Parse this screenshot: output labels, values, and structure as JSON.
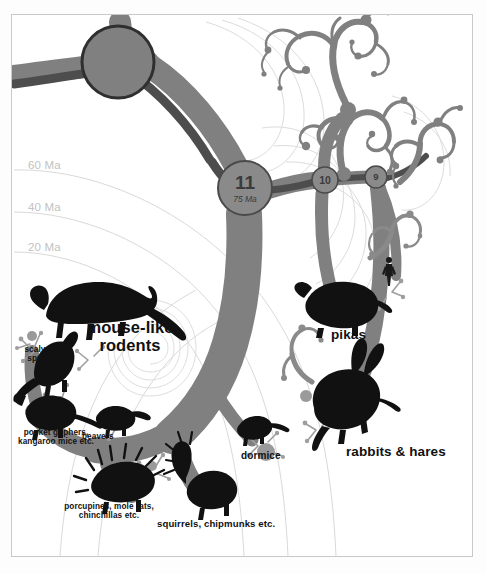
{
  "figure": {
    "kind": "phylogenetic-tree",
    "background_color": "#ffffff",
    "frame_color": "#c9c9c9",
    "branch_color": "#808080",
    "branch_dark_color": "#4d4d4d",
    "silhouette_color": "#111111",
    "axis_color": "#c2c2c2",
    "label_color": "#111111"
  },
  "axis": {
    "name": "time-axis",
    "unit": "Ma",
    "ticks": [
      {
        "label": "60 Ma",
        "value": 60
      },
      {
        "label": "40 Ma",
        "value": 40
      },
      {
        "label": "20 Ma",
        "value": 20
      }
    ]
  },
  "nodes": [
    {
      "id": "root-node",
      "number": "",
      "age": "",
      "cx": 118,
      "cy": 62,
      "r": 36,
      "style": "large-plain"
    },
    {
      "id": "node-11",
      "number": "11",
      "age": "75 Ma",
      "cx": 245,
      "cy": 188,
      "r": 27,
      "style": "labelled"
    },
    {
      "id": "node-10",
      "number": "10",
      "age": "",
      "cx": 325,
      "cy": 180,
      "r": 13,
      "style": "labelled"
    },
    {
      "id": "node-9",
      "number": "9",
      "age": "",
      "cx": 376,
      "cy": 177,
      "r": 11,
      "style": "labelled"
    }
  ],
  "taxa": [
    {
      "name": "mouse-like-rodents",
      "label": "mouse-like\nrodents",
      "size": "big",
      "x": 78,
      "y": 318
    },
    {
      "name": "scaly-tails-springhare",
      "label": "scaly-tails &\nspringhare",
      "size": "tiny",
      "x": 10,
      "y": 345
    },
    {
      "name": "pocket-gophers-kangaroo-mice",
      "label": "pocket gophers,\nkangaroo mice etc.",
      "size": "tiny",
      "x": 8,
      "y": 428
    },
    {
      "name": "beavers",
      "label": "beavers",
      "size": "tiny",
      "x": 82,
      "y": 432
    },
    {
      "name": "porcupines-mole-rats-chinchillas",
      "label": "porcupines, mole rats,\nchinchillas etc.",
      "size": "tiny",
      "x": 54,
      "y": 502
    },
    {
      "name": "squirrels-chipmunks",
      "label": "squirrels, chipmunks etc.",
      "size": "small",
      "x": 157,
      "y": 519
    },
    {
      "name": "dormice",
      "label": "dormice",
      "size": "small",
      "x": 241,
      "y": 450
    },
    {
      "name": "pikas",
      "label": "pikas",
      "size": "mid",
      "x": 331,
      "y": 327
    },
    {
      "name": "rabbits-hares",
      "label": "rabbits & hares",
      "size": "mid",
      "x": 346,
      "y": 444
    }
  ],
  "silhouettes": [
    {
      "name": "rat-silhouette",
      "taxon": "mouse-like rodents"
    },
    {
      "name": "springhare-silhouette",
      "taxon": "scaly-tails & springhare"
    },
    {
      "name": "pocket-gopher-silhouette",
      "taxon": "pocket gophers, kangaroo mice etc."
    },
    {
      "name": "beaver-silhouette",
      "taxon": "beavers"
    },
    {
      "name": "porcupine-silhouette",
      "taxon": "porcupines, mole rats, chinchillas etc."
    },
    {
      "name": "squirrel-silhouette",
      "taxon": "squirrels, chipmunks etc."
    },
    {
      "name": "dormouse-silhouette",
      "taxon": "dormice"
    },
    {
      "name": "pika-silhouette",
      "taxon": "pikas"
    },
    {
      "name": "hare-silhouette",
      "taxon": "rabbits & hares"
    },
    {
      "name": "human-figure-silhouette",
      "taxon": "human scale figure"
    }
  ]
}
